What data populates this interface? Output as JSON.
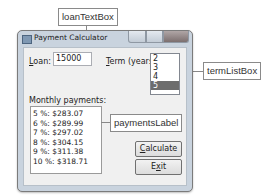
{
  "callouts": {
    "loan": "loanTextBox",
    "term": "termListBox",
    "payments": "paymentsLabel"
  },
  "window": {
    "title": "Payment Calculator",
    "controls": [
      "minimize",
      "maximize",
      "close"
    ]
  },
  "form": {
    "loan_label_mnemonic": "L",
    "loan_label_rest": "oan:",
    "loan_value": "15000",
    "term_label_mnemonic": "T",
    "term_label_rest": "erm (years):",
    "term_options": [
      "2",
      "3",
      "4",
      "5"
    ],
    "term_selected": "5",
    "monthly_label": "Monthly payments:",
    "payments": [
      "5 %:  $283.07",
      "6 %:  $289.99",
      "7 %:  $297.02",
      "8 %:  $304.15",
      "9 %:  $311.38",
      "10 %:  $318.71"
    ],
    "calculate_mnemonic": "C",
    "calculate_rest": "alculate",
    "exit_pre": "E",
    "exit_mnemonic": "x",
    "exit_rest": "it"
  },
  "colors": {
    "selected_item": "#6d6d6d",
    "window_frame": "#c9d3de",
    "client_bg": "#f0f0f0"
  }
}
